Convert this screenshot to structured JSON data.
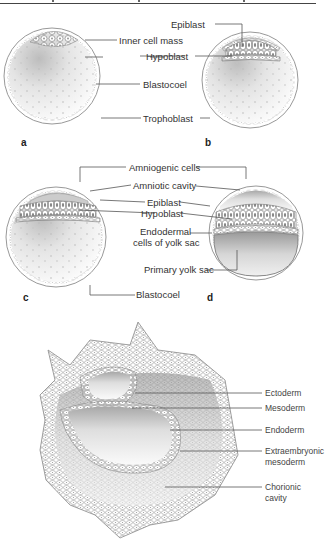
{
  "figure": {
    "panels": {
      "a": {
        "letter": "a",
        "labels": {
          "inner_cell_mass": "Inner cell mass"
        }
      },
      "b": {
        "letter": "b",
        "labels": {
          "epiblast": "Epiblast",
          "hypoblast": "Hypoblast"
        }
      },
      "ab_shared": {
        "blastocoel": "Blastocoel",
        "trophoblast": "Trophoblast"
      },
      "c": {
        "letter": "c",
        "labels": {
          "blastocoel": "Blastocoel"
        }
      },
      "d": {
        "letter": "d",
        "labels": {
          "primary_yolk_sac": "Primary yolk sac"
        }
      },
      "cd_shared": {
        "amniogenic_cells": "Amniogenic cells",
        "amniotic_cavity": "Amniotic cavity",
        "epiblast": "Epiblast",
        "hypoblast": "Hypoblast",
        "endodermal_line1": "Endodermal",
        "endodermal_line2": "cells of yolk sac"
      },
      "e": {
        "labels": {
          "ectoderm": "Ectoderm",
          "mesoderm": "Mesoderm",
          "endoderm": "Endoderm",
          "extraembryonic_line1": "Extraembryonic",
          "extraembryonic_line2": "mesoderm",
          "chorionic_line1": "Chorionic",
          "chorionic_line2": "cavity"
        }
      }
    },
    "colors": {
      "line": "#555555",
      "text": "#333333",
      "cell_outline": "#8a8a8a",
      "cavity_shade": "#d9d9d9"
    }
  }
}
